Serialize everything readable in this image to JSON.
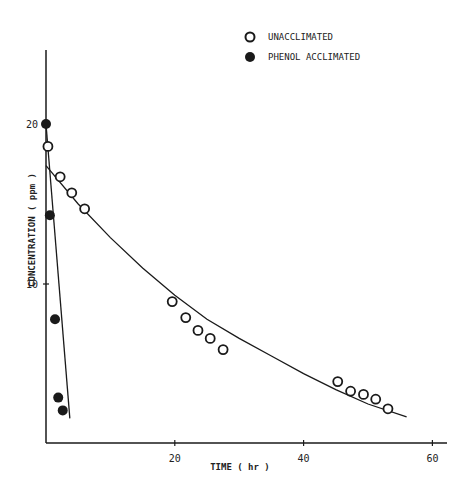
{
  "chart_data": {
    "type": "scatter",
    "title": "",
    "xlabel": "TIME ( hr )",
    "ylabel": "CONCENTRATION ( ppm )",
    "xlim": [
      0,
      62
    ],
    "ylim": [
      0,
      23
    ],
    "x_ticks": [
      20,
      40,
      60
    ],
    "x_tick_labels": [
      "20",
      "40",
      "60"
    ],
    "y_ticks": [
      10,
      20
    ],
    "y_tick_labels": [
      "10",
      "20"
    ],
    "grid": false,
    "legend_position": "top-right",
    "series": [
      {
        "name": "UNACCLIMATED",
        "marker": "open-circle",
        "x": [
          0.3,
          2.2,
          4.0,
          6.0,
          19.6,
          21.7,
          23.6,
          25.5,
          27.5,
          45.3,
          47.3,
          49.3,
          51.2,
          53.1
        ],
        "y": [
          18.6,
          16.7,
          15.7,
          14.7,
          8.9,
          7.9,
          7.1,
          6.6,
          5.9,
          3.9,
          3.3,
          3.1,
          2.8,
          2.2
        ],
        "fit_curve": {
          "x": [
            0,
            5,
            10,
            15,
            20,
            25,
            30,
            35,
            40,
            45,
            50,
            56
          ],
          "y": [
            17.4,
            15.0,
            12.9,
            11.0,
            9.3,
            7.8,
            6.6,
            5.5,
            4.4,
            3.4,
            2.5,
            1.7
          ]
        }
      },
      {
        "name": "PHENOL ACCLIMATED",
        "marker": "filled-circle",
        "x": [
          0.0,
          0.6,
          1.4,
          1.9,
          2.6
        ],
        "y": [
          20.0,
          14.3,
          7.8,
          2.9,
          2.1
        ],
        "fit_line": {
          "x": [
            0,
            3.7
          ],
          "y": [
            20.0,
            1.6
          ]
        }
      }
    ]
  },
  "legend": {
    "items": [
      {
        "label": "UNACCLIMATED",
        "marker": "open-circle"
      },
      {
        "label": "PHENOL ACCLIMATED",
        "marker": "filled-circle"
      }
    ]
  },
  "axes": {
    "x_title": "TIME ( hr )",
    "y_title": "CONCENTRATION ( ppm )",
    "x_tick_labels": [
      "20",
      "40",
      "60"
    ],
    "y_tick_labels": [
      "10",
      "20"
    ]
  },
  "colors": {
    "ink": "#1a1a1a",
    "background": "#ffffff"
  }
}
